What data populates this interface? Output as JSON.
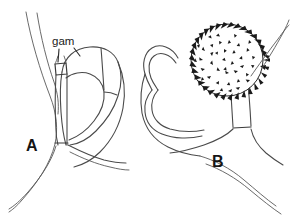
{
  "figure": {
    "type": "scientific-line-drawing",
    "background_color": "#ffffff",
    "ink_color": "#3a3a3a",
    "width": 290,
    "height": 221,
    "panels": [
      {
        "id": "A",
        "label": "A",
        "label_x": 28,
        "label_y": 148,
        "description": "Line drawing of a gametangium attached to a hypha, with a small antheridial cell labelled gam",
        "callouts": [
          {
            "id": "gam",
            "label": "gam",
            "label_x": 53,
            "label_y": 45,
            "leader_lines": 2
          }
        ]
      },
      {
        "id": "B",
        "label": "B",
        "label_x": 213,
        "label_y": 163,
        "description": "Line drawing of a mature spiny oospore within an oogonium attached to hyphae",
        "callouts": []
      }
    ]
  },
  "labels": {
    "panel_a": "A",
    "panel_b": "B",
    "gametangium": "gam"
  },
  "colors": {
    "background": "#ffffff",
    "outline": "#4a4a4a",
    "outline_dark": "#3a3a3a",
    "text": "#151515",
    "spine": "#1a1a1a"
  }
}
